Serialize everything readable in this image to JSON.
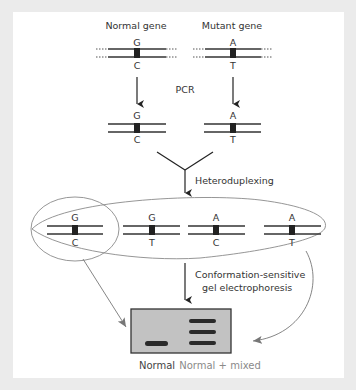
{
  "diagram": {
    "headers": {
      "normal": "Normal gene",
      "mutant": "Mutant gene"
    },
    "step1": "PCR",
    "step2": "Heteroduplexing",
    "step3_line1": "Conformation-sensitive",
    "step3_line2": "gel electrophoresis",
    "genomic": {
      "normal": {
        "top": "G",
        "bottom": "C"
      },
      "mutant": {
        "top": "A",
        "bottom": "T"
      }
    },
    "amplified": {
      "normal": {
        "top": "G",
        "bottom": "C"
      },
      "mutant": {
        "top": "A",
        "bottom": "T"
      }
    },
    "duplexes": [
      {
        "top": "G",
        "bottom": "C",
        "type": "homoduplex-normal"
      },
      {
        "top": "G",
        "bottom": "T",
        "type": "heteroduplex"
      },
      {
        "top": "A",
        "bottom": "C",
        "type": "heteroduplex"
      },
      {
        "top": "A",
        "bottom": "T",
        "type": "homoduplex-mutant"
      }
    ],
    "gel": {
      "lanes": [
        {
          "label": "Normal",
          "bands": 1
        },
        {
          "label": "Normal + mixed",
          "bands": 3
        }
      ]
    },
    "colors": {
      "background": "#ebebeb",
      "panel": "#ffffff",
      "strand": "#333333",
      "gel_fill": "#c2c2c2",
      "band": "#2a2a2a",
      "outline": "#8a8a8a"
    }
  }
}
